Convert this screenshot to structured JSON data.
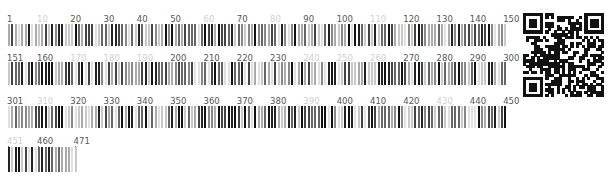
{
  "barcode": {
    "title": "Sequence barcode",
    "total_length": 471,
    "per_row": 150,
    "rows": [
      {
        "start": 1,
        "end": 150,
        "labels": [
          {
            "pos": 1,
            "text": "1",
            "faint": false
          },
          {
            "pos": 10,
            "text": "10",
            "faint": true
          },
          {
            "pos": 20,
            "text": "20",
            "faint": false
          },
          {
            "pos": 30,
            "text": "30",
            "faint": false
          },
          {
            "pos": 40,
            "text": "40",
            "faint": false
          },
          {
            "pos": 50,
            "text": "50",
            "faint": false
          },
          {
            "pos": 60,
            "text": "60",
            "faint": true
          },
          {
            "pos": 70,
            "text": "70",
            "faint": false
          },
          {
            "pos": 80,
            "text": "80",
            "faint": true
          },
          {
            "pos": 90,
            "text": "90",
            "faint": false
          },
          {
            "pos": 100,
            "text": "100",
            "faint": false
          },
          {
            "pos": 110,
            "text": "110",
            "faint": true
          },
          {
            "pos": 120,
            "text": "120",
            "faint": false
          },
          {
            "pos": 130,
            "text": "130",
            "faint": false
          },
          {
            "pos": 140,
            "text": "140",
            "faint": false
          },
          {
            "pos": 150,
            "text": "150",
            "faint": false
          }
        ]
      },
      {
        "start": 151,
        "end": 300,
        "labels": [
          {
            "pos": 151,
            "text": "151",
            "faint": false
          },
          {
            "pos": 160,
            "text": "160",
            "faint": false
          },
          {
            "pos": 170,
            "text": "170",
            "faint": true
          },
          {
            "pos": 180,
            "text": "180",
            "faint": true
          },
          {
            "pos": 190,
            "text": "190",
            "faint": true
          },
          {
            "pos": 200,
            "text": "200",
            "faint": false
          },
          {
            "pos": 210,
            "text": "210",
            "faint": false
          },
          {
            "pos": 220,
            "text": "220",
            "faint": false
          },
          {
            "pos": 230,
            "text": "230",
            "faint": false
          },
          {
            "pos": 240,
            "text": "240",
            "faint": true
          },
          {
            "pos": 250,
            "text": "250",
            "faint": true
          },
          {
            "pos": 260,
            "text": "260",
            "faint": true
          },
          {
            "pos": 270,
            "text": "270",
            "faint": false
          },
          {
            "pos": 280,
            "text": "280",
            "faint": false
          },
          {
            "pos": 290,
            "text": "290",
            "faint": false
          },
          {
            "pos": 300,
            "text": "300",
            "faint": false
          }
        ]
      },
      {
        "start": 301,
        "end": 450,
        "labels": [
          {
            "pos": 301,
            "text": "301",
            "faint": false
          },
          {
            "pos": 310,
            "text": "310",
            "faint": true
          },
          {
            "pos": 320,
            "text": "320",
            "faint": false
          },
          {
            "pos": 330,
            "text": "330",
            "faint": false
          },
          {
            "pos": 340,
            "text": "340",
            "faint": false
          },
          {
            "pos": 350,
            "text": "350",
            "faint": false
          },
          {
            "pos": 360,
            "text": "360",
            "faint": false
          },
          {
            "pos": 370,
            "text": "370",
            "faint": false
          },
          {
            "pos": 380,
            "text": "380",
            "faint": false
          },
          {
            "pos": 390,
            "text": "390",
            "faint": true
          },
          {
            "pos": 400,
            "text": "400",
            "faint": false
          },
          {
            "pos": 410,
            "text": "410",
            "faint": false
          },
          {
            "pos": 420,
            "text": "420",
            "faint": false
          },
          {
            "pos": 430,
            "text": "430",
            "faint": true
          },
          {
            "pos": 440,
            "text": "440",
            "faint": false
          },
          {
            "pos": 450,
            "text": "450",
            "faint": false
          }
        ]
      },
      {
        "start": 451,
        "end": 471,
        "labels": [
          {
            "pos": 451,
            "text": "451",
            "faint": true
          },
          {
            "pos": 460,
            "text": "460",
            "faint": false
          },
          {
            "pos": 471,
            "text": "471",
            "faint": false
          }
        ]
      }
    ],
    "colors": {
      "label": "#555555",
      "label_faint": "#d0d0d0",
      "bar_dark": "#111111",
      "bar_light": "#dddddd"
    }
  },
  "qr_code": {
    "label": "QR code"
  }
}
